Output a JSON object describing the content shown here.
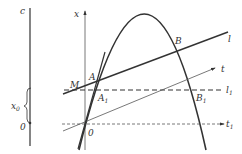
{
  "figure": {
    "left_axis": {
      "top_label": "c",
      "origin_label": "0",
      "brace_label": "x",
      "brace_sub": "0"
    },
    "axis": {
      "label": "x"
    },
    "points": {
      "M": "M",
      "A": "A",
      "A1": "A",
      "A1_sub": "1",
      "B": "B",
      "B1": "B",
      "B1_sub": "1",
      "O": "0"
    },
    "lines": {
      "l": "l",
      "t": "t",
      "l1": "l",
      "l1_sub": "1",
      "t1": "t",
      "t1_sub": "1"
    },
    "colors": {
      "stroke": "#333333",
      "background": "#ffffff"
    }
  }
}
